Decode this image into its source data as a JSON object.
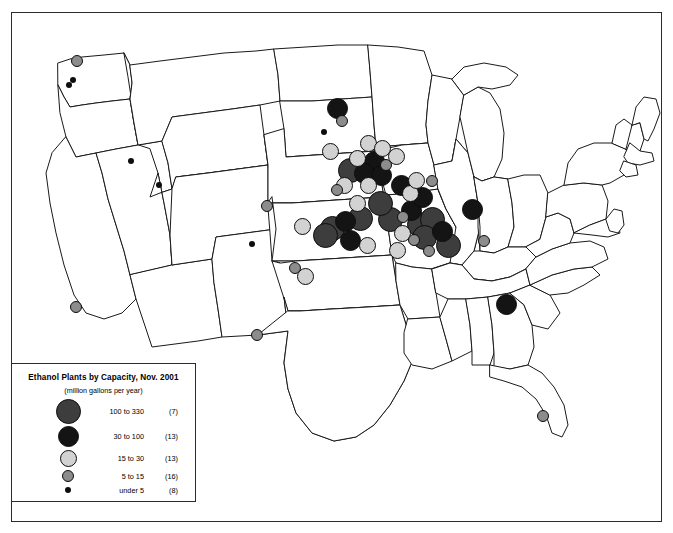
{
  "figure": {
    "type": "map",
    "region": "Contiguous United States",
    "background_color": "#ffffff",
    "border_color": "#2b2b2b",
    "state_outline_color": "#1a1a1a"
  },
  "legend": {
    "title": "Ethanol Plants by Capacity, Nov. 2001",
    "subtitle": "(million gallons per year)",
    "classes": [
      {
        "range": "100 to 330",
        "count": "(7)",
        "color": "#3d3d3d",
        "radius": 12.5,
        "min": 100,
        "max": 330,
        "n": 7
      },
      {
        "range": "30 to 100",
        "count": "(13)",
        "color": "#141414",
        "radius": 10.5,
        "min": 30,
        "max": 100,
        "n": 13
      },
      {
        "range": "15 to  30",
        "count": "(13)",
        "color": "#d2d2d2",
        "radius": 8.5,
        "min": 15,
        "max": 30,
        "n": 13
      },
      {
        "range": "5 to  15",
        "count": "(16)",
        "color": "#8c8c8c",
        "radius": 6.0,
        "min": 5,
        "max": 15,
        "n": 16
      },
      {
        "range": "under 5",
        "count": "(8)",
        "color": "#0d0d0d",
        "radius": 3.0,
        "min": 0,
        "max": 5,
        "n": 8
      }
    ]
  },
  "chart_data": {
    "type": "map",
    "title": "Ethanol Plants by Capacity, Nov. 2001",
    "subtitle": "(million gallons per year)",
    "unit": "million gallons per year",
    "total_plants": 57,
    "class_counts": {
      "100_to_330": 7,
      "30_to_100": 13,
      "15_to_30": 13,
      "5_to_15": 16,
      "under_5": 8
    },
    "points": [
      {
        "x": 65,
        "y": 48,
        "cls": 3,
        "state": "WA"
      },
      {
        "x": 61,
        "y": 67,
        "cls": 4,
        "state": "WA"
      },
      {
        "x": 57,
        "y": 72,
        "cls": 4,
        "state": "WA"
      },
      {
        "x": 119,
        "y": 148,
        "cls": 4,
        "state": "ID"
      },
      {
        "x": 147,
        "y": 172,
        "cls": 4,
        "state": "WY"
      },
      {
        "x": 240,
        "y": 231,
        "cls": 4,
        "state": "CO"
      },
      {
        "x": 64,
        "y": 294,
        "cls": 3,
        "state": "CA"
      },
      {
        "x": 245,
        "y": 322,
        "cls": 3,
        "state": "NM"
      },
      {
        "x": 325,
        "y": 95,
        "cls": 1,
        "state": "ND"
      },
      {
        "x": 330,
        "y": 108,
        "cls": 3,
        "state": "ND"
      },
      {
        "x": 318,
        "y": 138,
        "cls": 2,
        "state": "SD"
      },
      {
        "x": 356,
        "y": 130,
        "cls": 2,
        "state": "MN"
      },
      {
        "x": 370,
        "y": 135,
        "cls": 2,
        "state": "MN"
      },
      {
        "x": 345,
        "y": 145,
        "cls": 2,
        "state": "MN"
      },
      {
        "x": 362,
        "y": 148,
        "cls": 1,
        "state": "MN"
      },
      {
        "x": 352,
        "y": 160,
        "cls": 1,
        "state": "MN"
      },
      {
        "x": 338,
        "y": 157,
        "cls": 0,
        "state": "SD"
      },
      {
        "x": 374,
        "y": 152,
        "cls": 3,
        "state": "MN"
      },
      {
        "x": 384,
        "y": 143,
        "cls": 2,
        "state": "MN"
      },
      {
        "x": 356,
        "y": 172,
        "cls": 2,
        "state": "IA"
      },
      {
        "x": 369,
        "y": 162,
        "cls": 1,
        "state": "IA"
      },
      {
        "x": 332,
        "y": 172,
        "cls": 2,
        "state": "SD"
      },
      {
        "x": 325,
        "y": 177,
        "cls": 3,
        "state": "NE"
      },
      {
        "x": 255,
        "y": 193,
        "cls": 3,
        "state": "WY"
      },
      {
        "x": 290,
        "y": 213,
        "cls": 2,
        "state": "NE"
      },
      {
        "x": 320,
        "y": 215,
        "cls": 0,
        "state": "NE"
      },
      {
        "x": 333,
        "y": 208,
        "cls": 1,
        "state": "NE"
      },
      {
        "x": 348,
        "y": 205,
        "cls": 0,
        "state": "NE"
      },
      {
        "x": 313,
        "y": 222,
        "cls": 0,
        "state": "NE"
      },
      {
        "x": 338,
        "y": 227,
        "cls": 1,
        "state": "NE"
      },
      {
        "x": 355,
        "y": 232,
        "cls": 2,
        "state": "KS"
      },
      {
        "x": 385,
        "y": 237,
        "cls": 2,
        "state": "MO"
      },
      {
        "x": 283,
        "y": 255,
        "cls": 3,
        "state": "CO"
      },
      {
        "x": 293,
        "y": 263,
        "cls": 2,
        "state": "KS"
      },
      {
        "x": 378,
        "y": 206,
        "cls": 0,
        "state": "IA"
      },
      {
        "x": 391,
        "y": 204,
        "cls": 3,
        "state": "IA"
      },
      {
        "x": 399,
        "y": 197,
        "cls": 1,
        "state": "IA"
      },
      {
        "x": 407,
        "y": 211,
        "cls": 0,
        "state": "IA"
      },
      {
        "x": 420,
        "y": 206,
        "cls": 0,
        "state": "IA"
      },
      {
        "x": 412,
        "y": 224,
        "cls": 0,
        "state": "IL"
      },
      {
        "x": 430,
        "y": 218,
        "cls": 1,
        "state": "IL"
      },
      {
        "x": 436,
        "y": 232,
        "cls": 0,
        "state": "IL"
      },
      {
        "x": 417,
        "y": 238,
        "cls": 3,
        "state": "IL"
      },
      {
        "x": 402,
        "y": 227,
        "cls": 3,
        "state": "IA"
      },
      {
        "x": 390,
        "y": 220,
        "cls": 2,
        "state": "IA"
      },
      {
        "x": 398,
        "y": 180,
        "cls": 2,
        "state": "IA"
      },
      {
        "x": 404,
        "y": 167,
        "cls": 2,
        "state": "WI"
      },
      {
        "x": 410,
        "y": 184,
        "cls": 1,
        "state": "WI"
      },
      {
        "x": 389,
        "y": 172,
        "cls": 1,
        "state": "IA"
      },
      {
        "x": 460,
        "y": 196,
        "cls": 1,
        "state": "IN"
      },
      {
        "x": 472,
        "y": 228,
        "cls": 3,
        "state": "IN"
      },
      {
        "x": 494,
        "y": 291,
        "cls": 1,
        "state": "TN"
      },
      {
        "x": 531,
        "y": 403,
        "cls": 3,
        "state": "FL"
      },
      {
        "x": 312,
        "y": 119,
        "cls": 4,
        "state": "SD"
      },
      {
        "x": 420,
        "y": 168,
        "cls": 3,
        "state": "WI"
      },
      {
        "x": 345,
        "y": 190,
        "cls": 2,
        "state": "NE"
      },
      {
        "x": 368,
        "y": 190,
        "cls": 0,
        "state": "IA"
      }
    ]
  }
}
